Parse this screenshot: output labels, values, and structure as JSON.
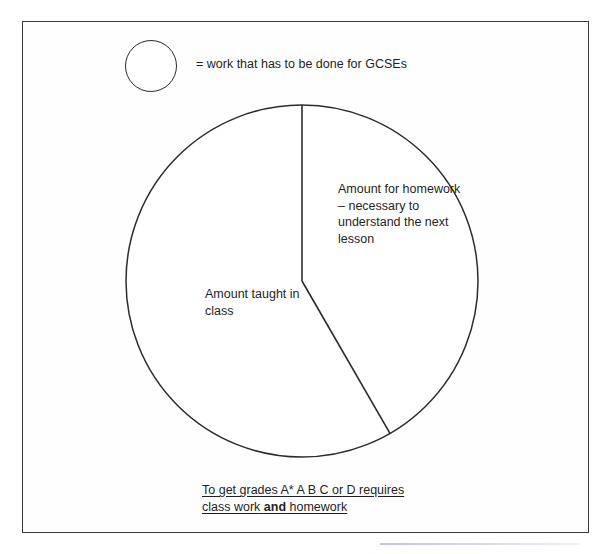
{
  "page": {
    "background_color": "#ffffff",
    "frame_color": "#3a3a46",
    "ink_color": "#1f1f25"
  },
  "legend": {
    "symbol": "circle-outline",
    "text": "= work that has to be done for GCSEs"
  },
  "labels": {
    "homework": "Amount for homework – necessary to understand the next lesson",
    "class": "Amount taught in class"
  },
  "caption": {
    "line1": "To get grades A* A B C or D requires",
    "line2_prefix": "class work ",
    "line2_bold": "and",
    "line2_suffix": " homework"
  },
  "chart_data": {
    "type": "pie",
    "title": "",
    "categories": [
      "Amount for homework – necessary to understand the next lesson",
      "Amount taught in class"
    ],
    "values": [
      30,
      70
    ],
    "units": "percent",
    "start_angle_deg": 0,
    "direction": "clockwise",
    "legend": "= work that has to be done for GCSEs",
    "grid": false,
    "labels_inside": true,
    "slice_angles_deg": [
      150,
      210
    ],
    "center_px": [
      302,
      281
    ],
    "radius_px": 176,
    "stroke_color": "#2a2a30",
    "fill_color": "#ffffff"
  }
}
